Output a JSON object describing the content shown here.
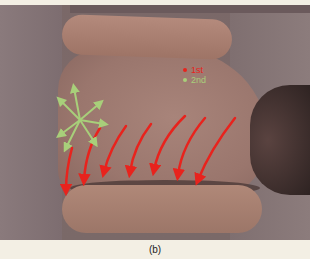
{
  "figure": {
    "caption": "(b)",
    "legend": [
      {
        "label": "1st",
        "color": "#e8231d"
      },
      {
        "label": "2nd",
        "color": "#a8cf7a"
      }
    ],
    "colors": {
      "red_arrows": "#e8231d",
      "green_arrows": "#a8cf7a",
      "background": "#f3efe4"
    }
  }
}
